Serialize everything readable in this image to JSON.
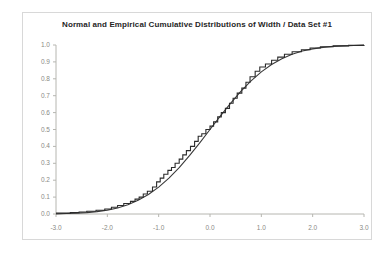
{
  "chart_data": {
    "type": "line",
    "title": "Normal and Empirical  Cumulative Distributions of Width / Data Set #1",
    "xlabel": "",
    "ylabel": "",
    "xlim": [
      -3.0,
      3.0
    ],
    "ylim": [
      0.0,
      1.0
    ],
    "grid": false,
    "legend_position": "none",
    "xticks": [
      "-3.0",
      "-2.0",
      "-1.0",
      "0.0",
      "1.0",
      "2.0",
      "3.0"
    ],
    "xtick_values": [
      -3.0,
      -2.0,
      -1.0,
      0.0,
      1.0,
      2.0,
      3.0
    ],
    "yticks": [
      "0.0",
      "0.1",
      "0.2",
      "0.3",
      "0.4",
      "0.5",
      "0.6",
      "0.7",
      "0.8",
      "0.9",
      "1.0"
    ],
    "ytick_values": [
      0.0,
      0.1,
      0.2,
      0.3,
      0.4,
      0.5,
      0.6,
      0.7,
      0.8,
      0.9,
      1.0
    ],
    "series": [
      {
        "name": "Normal Cumulative Distribution",
        "style": "smooth-line",
        "color": "#3a3a3a",
        "x": [
          -3.0,
          -2.8,
          -2.6,
          -2.4,
          -2.2,
          -2.0,
          -1.8,
          -1.6,
          -1.4,
          -1.2,
          -1.0,
          -0.8,
          -0.6,
          -0.4,
          -0.2,
          0.0,
          0.2,
          0.4,
          0.6,
          0.8,
          1.0,
          1.2,
          1.4,
          1.6,
          1.8,
          2.0,
          2.2,
          2.4,
          2.6,
          2.8,
          3.0
        ],
        "values": [
          0.001,
          0.003,
          0.005,
          0.008,
          0.014,
          0.023,
          0.036,
          0.055,
          0.081,
          0.115,
          0.159,
          0.212,
          0.274,
          0.345,
          0.421,
          0.5,
          0.579,
          0.655,
          0.726,
          0.788,
          0.841,
          0.885,
          0.919,
          0.945,
          0.964,
          0.977,
          0.986,
          0.992,
          0.995,
          0.997,
          0.999
        ]
      },
      {
        "name": "Empirical Cumulative Distribution",
        "style": "step-line",
        "color": "#2b2b2b",
        "x": [
          -3.0,
          -2.72,
          -2.55,
          -2.4,
          -2.22,
          -2.05,
          -1.92,
          -1.8,
          -1.68,
          -1.55,
          -1.46,
          -1.38,
          -1.3,
          -1.22,
          -1.12,
          -1.04,
          -0.97,
          -0.9,
          -0.82,
          -0.75,
          -0.68,
          -0.6,
          -0.53,
          -0.46,
          -0.38,
          -0.3,
          -0.23,
          -0.16,
          -0.08,
          0.0,
          0.07,
          0.15,
          0.22,
          0.3,
          0.38,
          0.45,
          0.53,
          0.62,
          0.7,
          0.78,
          0.88,
          0.97,
          1.08,
          1.2,
          1.32,
          1.45,
          1.6,
          1.78,
          1.95,
          2.15,
          2.4,
          2.7,
          3.0
        ],
        "values": [
          0.005,
          0.008,
          0.012,
          0.016,
          0.022,
          0.03,
          0.04,
          0.05,
          0.062,
          0.075,
          0.088,
          0.1,
          0.118,
          0.135,
          0.16,
          0.19,
          0.212,
          0.235,
          0.258,
          0.275,
          0.3,
          0.325,
          0.35,
          0.375,
          0.4,
          0.43,
          0.46,
          0.475,
          0.5,
          0.52,
          0.545,
          0.575,
          0.6,
          0.625,
          0.655,
          0.685,
          0.715,
          0.745,
          0.78,
          0.812,
          0.845,
          0.87,
          0.888,
          0.91,
          0.928,
          0.945,
          0.96,
          0.972,
          0.982,
          0.99,
          0.995,
          0.998,
          1.0
        ]
      }
    ]
  },
  "colors": {
    "title_text": "#26261f",
    "tick_text": "#8a8a84",
    "axis_line": "#b6b6b0",
    "frame_border": "#d8d8d8",
    "curve": "#3a3a3a",
    "background": "#ffffff"
  }
}
